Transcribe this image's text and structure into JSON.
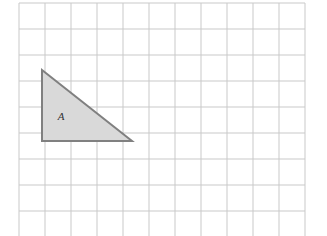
{
  "figure": {
    "background_color": "#ffffff",
    "width": 327,
    "height": 236
  },
  "grid": {
    "name": "square-grid",
    "origin_x": 19,
    "origin_y": 3,
    "cell_size": 26,
    "columns": 11,
    "rows": 9,
    "line_color": "#c9c9c9",
    "line_width": 1,
    "border_color": "#c9c9c9",
    "visible": true
  },
  "shapes": [
    {
      "name": "triangle-a",
      "type": "right-triangle",
      "label": "A",
      "label_x": 61,
      "label_y": 120,
      "fill_color": "#d9d9d9",
      "stroke_color": "#808080",
      "stroke_width": 2,
      "points_px": "42,70 132,141 42,141",
      "vertices_px": [
        {
          "name": "apex-top-left",
          "x": 42,
          "y": 70
        },
        {
          "name": "right-angle-bottom-left",
          "x": 42,
          "y": 141
        },
        {
          "name": "bottom-right",
          "x": 132,
          "y": 141
        }
      ],
      "vertices_grid": [
        {
          "name": "apex-top-left",
          "col": 0.88,
          "row": 2.58
        },
        {
          "name": "right-angle-bottom-left",
          "col": 0.88,
          "row": 5.31
        },
        {
          "name": "bottom-right",
          "col": 4.35,
          "row": 5.31
        }
      ],
      "base_cells": 3.5,
      "height_cells": 2.75
    }
  ]
}
